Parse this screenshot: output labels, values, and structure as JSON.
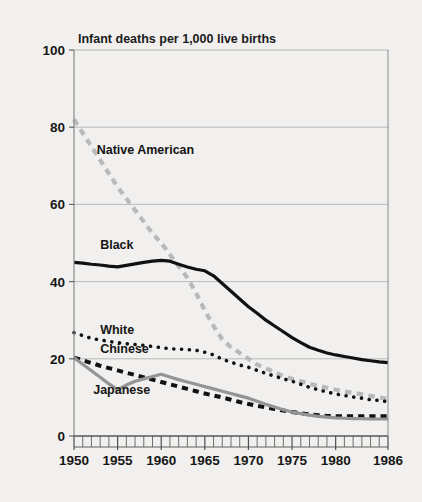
{
  "figure": {
    "background_color": "#f1f0ee",
    "plot_background_color": "#f1f0ee",
    "axis_color": "#8b8b8b",
    "gridline_color": "#b3b3b3"
  },
  "chart_data": {
    "type": "line",
    "title": "Infant deaths per 1,000 live births",
    "subtitle": "",
    "xlabel": "",
    "ylabel": "",
    "xlim": [
      1950,
      1986
    ],
    "ylim": [
      0,
      100
    ],
    "yticks": [
      0,
      20,
      40,
      60,
      80,
      100
    ],
    "ytick_labels": [
      "0",
      "20",
      "40",
      "60",
      "80",
      "100"
    ],
    "xticks": [
      1950,
      1955,
      1960,
      1965,
      1970,
      1975,
      1980,
      1986
    ],
    "xtick_labels": [
      "1950",
      "1955",
      "1960",
      "1965",
      "1970",
      "1975",
      "1980",
      "1986"
    ],
    "minor_xticks_interval": 1,
    "grid": "horizontal",
    "legend_position": "inline-labels",
    "x": [
      1950,
      1951,
      1952,
      1953,
      1954,
      1955,
      1956,
      1957,
      1958,
      1959,
      1960,
      1961,
      1962,
      1963,
      1964,
      1965,
      1966,
      1967,
      1968,
      1969,
      1970,
      1971,
      1972,
      1973,
      1974,
      1975,
      1976,
      1977,
      1978,
      1979,
      1980,
      1981,
      1982,
      1983,
      1984,
      1985,
      1986
    ],
    "series": [
      {
        "name": "Native American",
        "color": "#b9b9b9",
        "style": "dashed",
        "width": 4.2,
        "label_x": 1952.6,
        "label_y": 73,
        "values": [
          82.0,
          78.5,
          75.0,
          71.5,
          68.0,
          64.5,
          61.5,
          58.5,
          55.5,
          52.5,
          50.0,
          47.0,
          44.0,
          41.0,
          37.0,
          32.5,
          28.5,
          25.0,
          23.0,
          21.5,
          20.0,
          18.5,
          17.5,
          16.5,
          15.5,
          14.8,
          14.2,
          13.5,
          13.0,
          12.5,
          12.0,
          11.5,
          11.2,
          10.8,
          10.4,
          10.0,
          9.6
        ]
      },
      {
        "name": "Black",
        "color": "#111111",
        "style": "solid",
        "width": 3.2,
        "label_x": 1953.0,
        "label_y": 48.5,
        "values": [
          45.0,
          44.8,
          44.5,
          44.3,
          44.0,
          43.8,
          44.2,
          44.6,
          45.0,
          45.3,
          45.5,
          45.3,
          44.5,
          43.8,
          43.2,
          42.8,
          41.5,
          39.5,
          37.5,
          35.5,
          33.5,
          31.8,
          30.0,
          28.5,
          27.0,
          25.5,
          24.2,
          23.0,
          22.2,
          21.5,
          21.0,
          20.6,
          20.2,
          19.8,
          19.5,
          19.2,
          19.0
        ]
      },
      {
        "name": "White",
        "color": "#111111",
        "style": "dotted",
        "width": 3.6,
        "label_x": 1953.0,
        "label_y": 26.5,
        "values": [
          26.8,
          26.0,
          25.3,
          24.9,
          24.5,
          24.2,
          23.9,
          23.7,
          23.5,
          23.2,
          22.9,
          22.6,
          22.5,
          22.4,
          22.2,
          21.7,
          21.0,
          19.9,
          19.1,
          18.4,
          17.8,
          17.0,
          16.2,
          15.5,
          14.8,
          14.2,
          13.4,
          12.6,
          12.0,
          11.4,
          10.9,
          10.5,
          10.1,
          9.8,
          9.4,
          9.2,
          8.9
        ]
      },
      {
        "name": "Chinese",
        "color": "#111111",
        "style": "dashed",
        "width": 4.0,
        "label_x": 1953.0,
        "label_y": 21.5,
        "values": [
          20.3,
          19.6,
          18.9,
          18.2,
          17.6,
          17.0,
          16.4,
          15.8,
          15.2,
          14.6,
          14.0,
          13.4,
          12.8,
          12.2,
          11.6,
          11.0,
          10.5,
          10.0,
          9.4,
          8.8,
          8.3,
          7.8,
          7.4,
          7.0,
          6.6,
          6.2,
          5.9,
          5.6,
          5.4,
          5.2,
          5.1,
          5.1,
          5.1,
          5.1,
          5.1,
          5.1,
          5.1
        ]
      },
      {
        "name": "Japanese",
        "color": "#949494",
        "style": "solid",
        "width": 3.2,
        "label_x": 1952.2,
        "label_y": 10.8,
        "values": [
          20.3,
          18.6,
          16.9,
          15.2,
          13.5,
          12.0,
          13.2,
          14.2,
          14.8,
          15.4,
          16.0,
          15.3,
          14.6,
          14.0,
          13.4,
          12.8,
          12.2,
          11.6,
          11.0,
          10.4,
          9.8,
          9.0,
          8.2,
          7.5,
          6.8,
          6.2,
          5.8,
          5.4,
          5.1,
          4.9,
          4.7,
          4.6,
          4.5,
          4.5,
          4.4,
          4.4,
          4.4
        ]
      }
    ]
  }
}
